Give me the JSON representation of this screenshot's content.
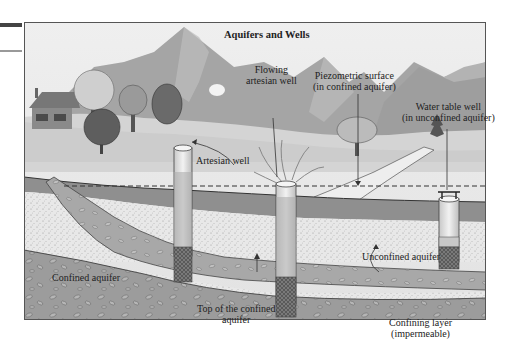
{
  "title": "Aquifers and Wells",
  "labels": {
    "flowing_artesian_well": [
      "Flowing",
      "artesian well"
    ],
    "piezometric_surface": [
      "Piezometric surface",
      "(in confined aquifer)"
    ],
    "water_table_well": [
      "Water table well",
      "(in unconfined aquifer)"
    ],
    "artesian_well": "Artesian well",
    "unconfined_aquifer": "Unconfined aquifer",
    "confined_aquifer": "Confined aquifer",
    "top_of_confined_aquifer": [
      "Top of the confined",
      "aquifer"
    ],
    "confining_layer": [
      "Confining layer",
      "(impermeable)"
    ]
  },
  "colors": {
    "sky": "#ececec",
    "mountain": "#a9a9a9",
    "mountain_light": "#c4c4c4",
    "ground_surface": "#d9d9d9",
    "confining_layer": "#8e8e8e",
    "aquifer_sand": "#e6e6e6",
    "bedrock": "#9a9a9a",
    "border": "#555555"
  }
}
